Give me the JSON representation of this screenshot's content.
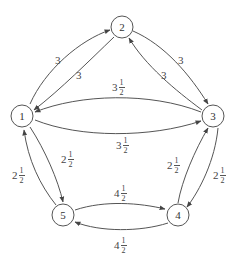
{
  "diagram": {
    "type": "directed-weighted-graph",
    "nodes": [
      {
        "id": "1",
        "label": "1",
        "x": 22,
        "y": 116
      },
      {
        "id": "2",
        "label": "2",
        "x": 122,
        "y": 27
      },
      {
        "id": "3",
        "label": "3",
        "x": 213,
        "y": 116
      },
      {
        "id": "4",
        "label": "4",
        "x": 178,
        "y": 215
      },
      {
        "id": "5",
        "label": "5",
        "x": 63,
        "y": 215
      }
    ],
    "edges": [
      {
        "from": "1",
        "to": "2",
        "weight": "3",
        "whole": "3",
        "num": "",
        "den": ""
      },
      {
        "from": "2",
        "to": "1",
        "weight": "3",
        "whole": "3",
        "num": "",
        "den": ""
      },
      {
        "from": "2",
        "to": "3",
        "weight": "3",
        "whole": "3",
        "num": "",
        "den": ""
      },
      {
        "from": "3",
        "to": "2",
        "weight": "3",
        "whole": "3",
        "num": "",
        "den": ""
      },
      {
        "from": "3",
        "to": "1",
        "weight": "3 1/2",
        "whole": "3",
        "num": "1",
        "den": "2"
      },
      {
        "from": "1",
        "to": "3",
        "weight": "3 1/2",
        "whole": "3",
        "num": "1",
        "den": "2"
      },
      {
        "from": "1",
        "to": "5",
        "weight": "2 1/2",
        "whole": "2",
        "num": "1",
        "den": "2"
      },
      {
        "from": "5",
        "to": "1",
        "weight": "2 1/2",
        "whole": "2",
        "num": "1",
        "den": "2"
      },
      {
        "from": "4",
        "to": "3",
        "weight": "2 1/2",
        "whole": "2",
        "num": "1",
        "den": "2"
      },
      {
        "from": "3",
        "to": "4",
        "weight": "2 1/2",
        "whole": "2",
        "num": "1",
        "den": "2"
      },
      {
        "from": "5",
        "to": "4",
        "weight": "4 1/2",
        "whole": "4",
        "num": "1",
        "den": "2"
      },
      {
        "from": "4",
        "to": "5",
        "weight": "4 1/2",
        "whole": "4",
        "num": "1",
        "den": "2"
      }
    ]
  }
}
